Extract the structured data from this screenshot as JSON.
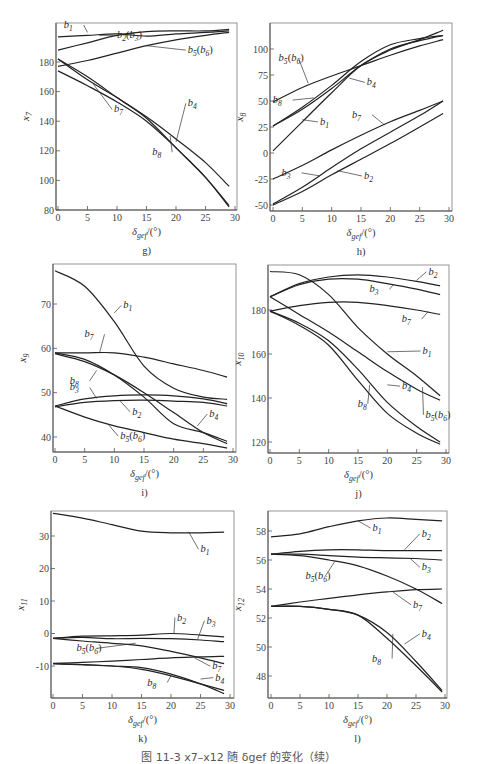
{
  "figure": {
    "caption": "图 11-3  x7–x12 随 δgef 的变化（续）",
    "x_axis_label": "δgef/(°)"
  },
  "chart_data": [
    {
      "id": "g",
      "panel_label": "g)",
      "type": "line",
      "ylabel": "x7",
      "xlabel": "δgef/(°)",
      "xlim": [
        0,
        30
      ],
      "ylim": [
        80,
        205
      ],
      "xticks": [
        0,
        5,
        10,
        15,
        20,
        25,
        30
      ],
      "yticks": [
        80,
        100,
        120,
        140,
        160,
        180
      ],
      "box": [
        56,
        23,
        237,
        210
      ],
      "xmap": [
        58,
        235
      ],
      "ymap": [
        [
          80,
          210
        ],
        [
          180,
          62
        ]
      ],
      "x": [
        0,
        5,
        10,
        15,
        20,
        25,
        29
      ],
      "series": [
        {
          "name": "b1",
          "values": [
            197,
            198,
            199,
            197.5,
            199,
            200,
            201
          ]
        },
        {
          "name": "b2(b3)",
          "values": [
            188,
            193,
            198,
            200.5,
            201,
            201,
            202
          ]
        },
        {
          "name": "b5(b6)",
          "values": [
            177,
            181,
            186,
            191,
            195,
            198,
            200
          ]
        },
        {
          "name": "b4",
          "values": [
            182,
            168,
            156,
            143,
            128,
            112,
            96
          ]
        },
        {
          "name": "b7",
          "values": [
            174,
            164,
            153,
            140,
            122,
            102,
            82
          ]
        },
        {
          "name": "b8",
          "values": [
            182,
            170,
            156,
            142,
            122,
            102,
            83
          ]
        }
      ],
      "labels": [
        {
          "text": "b1",
          "x": 3,
          "y": 203,
          "lx": 5,
          "ly": 200
        },
        {
          "text": "b2(b3)",
          "x": 10,
          "y": 196,
          "lx": 7,
          "ly": 198
        },
        {
          "text": "b5(b6)",
          "x": 22,
          "y": 186,
          "lx": 15,
          "ly": 191
        },
        {
          "text": "b7",
          "x": 9.5,
          "y": 146,
          "lx": 6,
          "ly": 165
        },
        {
          "text": "b4",
          "x": 22,
          "y": 150,
          "lx": 20,
          "ly": 126
        },
        {
          "text": "b8",
          "x": 18,
          "y": 117,
          "lx": 19,
          "ly": 130
        }
      ]
    },
    {
      "id": "h",
      "panel_label": "h)",
      "type": "line",
      "ylabel": "x8",
      "xlabel": "δgef/(°)",
      "xlim": [
        0,
        30
      ],
      "ylim": [
        -50,
        120
      ],
      "xticks": [
        0,
        5,
        10,
        15,
        20,
        25,
        30
      ],
      "yticks": [
        -50,
        -25,
        0,
        25,
        50,
        75,
        100
      ],
      "box": [
        270,
        23,
        452,
        211
      ],
      "xmap": [
        273,
        449
      ],
      "ymap": [
        [
          -50,
          205
        ],
        [
          100,
          49
        ]
      ],
      "x": [
        0,
        5,
        10,
        15,
        20,
        25,
        29
      ],
      "series": [
        {
          "name": "b5(b6)",
          "values": [
            49,
            63,
            74,
            84,
            94,
            103,
            109
          ]
        },
        {
          "name": "b4",
          "values": [
            26,
            42,
            62,
            84,
            100,
            108,
            113
          ]
        },
        {
          "name": "b8",
          "values": [
            26,
            44,
            65,
            88,
            104,
            110,
            113
          ]
        },
        {
          "name": "b1",
          "values": [
            2,
            30,
            58,
            84,
            99,
            109,
            118
          ]
        },
        {
          "name": "b7",
          "values": [
            -25,
            -12,
            3,
            17,
            30,
            41,
            50
          ]
        },
        {
          "name": "b3",
          "values": [
            -49,
            -33,
            -14,
            4,
            20,
            36,
            50
          ]
        },
        {
          "name": "b2",
          "values": [
            -50,
            -37,
            -21,
            -6,
            9,
            25,
            38
          ]
        }
      ],
      "labels": [
        {
          "text": "b5(b6)",
          "x": 3,
          "y": 88,
          "lx": 6,
          "ly": 67
        },
        {
          "text": "b8",
          "x": 2,
          "y": 48,
          "lx": 7,
          "ly": 53
        },
        {
          "text": "b4",
          "x": 16,
          "y": 65,
          "lx": 13,
          "ly": 72
        },
        {
          "text": "b1",
          "x": 8,
          "y": 27,
          "lx": 5,
          "ly": 32
        },
        {
          "text": "b7",
          "x": 15.5,
          "y": 34,
          "lx": 19,
          "ly": 27
        },
        {
          "text": "b3",
          "x": 3.5,
          "y": -22,
          "lx": 8,
          "ly": -22
        },
        {
          "text": "b2",
          "x": 15.5,
          "y": -25,
          "lx": 11,
          "ly": -17
        }
      ]
    },
    {
      "id": "i",
      "panel_label": "i)",
      "type": "line",
      "ylabel": "x9",
      "xlabel": "δgef/(°)",
      "xlim": [
        0,
        30
      ],
      "ylim": [
        37,
        78
      ],
      "xticks": [
        0,
        5,
        10,
        15,
        20,
        25,
        30
      ],
      "yticks": [
        40,
        50,
        60,
        70
      ],
      "box": [
        53,
        264,
        236,
        452
      ],
      "xmap": [
        55,
        233
      ],
      "ymap": [
        [
          40,
          437
        ],
        [
          70,
          304
        ]
      ],
      "x": [
        0,
        5,
        10,
        15,
        20,
        25,
        29
      ],
      "series": [
        {
          "name": "b1",
          "values": [
            77.5,
            74,
            66,
            56,
            51,
            49,
            48.5
          ]
        },
        {
          "name": "b7",
          "values": [
            59,
            59,
            59,
            58,
            56.5,
            55,
            53.5
          ]
        },
        {
          "name": "b8",
          "values": [
            59,
            57.5,
            54,
            49,
            43,
            41,
            39
          ]
        },
        {
          "name": "b4",
          "values": [
            58.8,
            57,
            54,
            50,
            45.5,
            41,
            38.5
          ]
        },
        {
          "name": "b3",
          "values": [
            47,
            48.6,
            49.3,
            49.5,
            49.3,
            48.6,
            47.5
          ]
        },
        {
          "name": "b2",
          "values": [
            46.8,
            47.8,
            48.2,
            48.3,
            48.1,
            47.8,
            47
          ]
        },
        {
          "name": "b5(b6)",
          "values": [
            47,
            44.5,
            42.5,
            41,
            39.5,
            38.5,
            37.5
          ]
        }
      ],
      "labels": [
        {
          "text": "b1",
          "x": 11.5,
          "y": 69,
          "lx": 10,
          "ly": 68
        },
        {
          "text": "b7",
          "x": 7,
          "y": 62.5,
          "lx": 7.5,
          "ly": 59
        },
        {
          "text": "b8",
          "x": 4.5,
          "y": 52,
          "lx": 7,
          "ly": 55
        },
        {
          "text": "b3",
          "x": 4.5,
          "y": 50.5,
          "lx": 7,
          "ly": 48.7
        },
        {
          "text": "b2",
          "x": 13,
          "y": 45,
          "lx": 11,
          "ly": 48.1
        },
        {
          "text": "b4",
          "x": 26,
          "y": 44.5,
          "lx": 24,
          "ly": 42.5
        },
        {
          "text": "b5(b6)",
          "x": 11,
          "y": 39.5,
          "lx": 9,
          "ly": 42.8
        }
      ]
    },
    {
      "id": "j",
      "panel_label": "j)",
      "type": "line",
      "ylabel": "x10",
      "xlabel": "δgef/(°)",
      "xlim": [
        0,
        30
      ],
      "ylim": [
        118,
        199
      ],
      "xticks": [
        0,
        5,
        10,
        15,
        20,
        25,
        30
      ],
      "yticks": [
        120,
        140,
        160,
        180
      ],
      "box": [
        268,
        265,
        449,
        453
      ],
      "xmap": [
        270,
        446
      ],
      "ymap": [
        [
          120,
          442
        ],
        [
          180,
          310
        ]
      ],
      "x": [
        0,
        5,
        10,
        15,
        20,
        25,
        29
      ],
      "series": [
        {
          "name": "b2",
          "values": [
            186,
            192,
            195,
            196,
            195,
            193,
            191
          ]
        },
        {
          "name": "b3",
          "values": [
            186,
            191.5,
            194,
            194,
            192,
            189.5,
            187
          ]
        },
        {
          "name": "b7",
          "values": [
            179.5,
            182,
            183.5,
            183.5,
            182,
            180,
            178
          ]
        },
        {
          "name": "b1",
          "values": [
            197.5,
            196,
            187,
            172,
            160,
            150,
            141
          ]
        },
        {
          "name": "b5(b6)",
          "values": [
            186,
            178,
            170,
            161,
            152,
            144,
            139
          ]
        },
        {
          "name": "b4",
          "values": [
            179.5,
            174,
            166,
            153,
            138,
            127,
            120
          ]
        },
        {
          "name": "b8",
          "values": [
            179.5,
            173,
            164,
            148,
            133,
            124,
            119
          ]
        }
      ],
      "labels": [
        {
          "text": "b2",
          "x": 27,
          "y": 196,
          "lx": 25,
          "ly": 193.5
        },
        {
          "text": "b3",
          "x": 19,
          "y": 188,
          "lx": 21,
          "ly": 191.5
        },
        {
          "text": "b7",
          "x": 24.5,
          "y": 174.5,
          "lx": 27,
          "ly": 179.5
        },
        {
          "text": "b1",
          "x": 26,
          "y": 160,
          "lx": 20,
          "ly": 161
        },
        {
          "text": "b4",
          "x": 22.5,
          "y": 144,
          "lx": 20,
          "ly": 146
        },
        {
          "text": "b8",
          "x": 17,
          "y": 136,
          "lx": 17,
          "ly": 146
        },
        {
          "text": "b5(b6)",
          "x": 26.5,
          "y": 131,
          "lx": 26,
          "ly": 145
        }
      ]
    },
    {
      "id": "k",
      "panel_label": "k)",
      "type": "line",
      "ylabel": "x11",
      "xlabel": "δgef/(°)",
      "xlim": [
        0,
        30
      ],
      "ylim": [
        -19,
        38
      ],
      "xticks": [
        0,
        5,
        10,
        15,
        20,
        25,
        30
      ],
      "yticks": [
        -10,
        0,
        10,
        20,
        30
      ],
      "box": [
        51,
        511,
        234,
        698
      ],
      "xmap": [
        53,
        230
      ],
      "ymap": [
        [
          30,
          536
        ],
        [
          -10,
          666
        ]
      ],
      "x": [
        0,
        5,
        10,
        15,
        20,
        25,
        29
      ],
      "series": [
        {
          "name": "b1",
          "values": [
            37,
            35.5,
            33.5,
            31.5,
            31,
            31,
            31.2
          ]
        },
        {
          "name": "b2",
          "values": [
            -1.5,
            -0.8,
            -0.7,
            -0.5,
            0,
            -0.5,
            -1
          ]
        },
        {
          "name": "b3",
          "values": [
            -1.5,
            -1.2,
            -1.6,
            -1.5,
            -1.6,
            -2,
            -2.5
          ]
        },
        {
          "name": "b5(b6)",
          "values": [
            -1.5,
            -2.3,
            -3,
            -3.8,
            -5.5,
            -7.5,
            -9.3
          ]
        },
        {
          "name": "b7",
          "values": [
            -9.2,
            -8.9,
            -8.5,
            -8,
            -7.5,
            -7.2,
            -7
          ]
        },
        {
          "name": "b4",
          "values": [
            -9.3,
            -9.6,
            -10,
            -11,
            -13,
            -15.5,
            -17.5
          ]
        },
        {
          "name": "b8",
          "values": [
            -9.3,
            -9.6,
            -10,
            -10.5,
            -12.5,
            -15.5,
            -18.5
          ]
        }
      ],
      "labels": [
        {
          "text": "b1",
          "x": 25,
          "y": 25,
          "lx": 23,
          "ly": 31.3
        },
        {
          "text": "b2",
          "x": 21,
          "y": 4,
          "lx": 20.5,
          "ly": 0
        },
        {
          "text": "b3",
          "x": 26,
          "y": 3,
          "lx": 24.5,
          "ly": -1.8
        },
        {
          "text": "b5(b6)",
          "x": 6,
          "y": -5.5,
          "lx": 14,
          "ly": -3
        },
        {
          "text": "b7",
          "x": 27,
          "y": -11,
          "lx": 24,
          "ly": -7.5
        },
        {
          "text": "b4",
          "x": 27.5,
          "y": -14.5,
          "lx": 25,
          "ly": -14
        },
        {
          "text": "b8",
          "x": 18,
          "y": -16,
          "lx": 20,
          "ly": -13
        }
      ]
    },
    {
      "id": "l",
      "panel_label": "l)",
      "type": "line",
      "ylabel": "x12",
      "xlabel": "δgef/(°)",
      "xlim": [
        0,
        30
      ],
      "ylim": [
        46.8,
        59.2
      ],
      "xticks": [
        0,
        5,
        10,
        15,
        20,
        25,
        30
      ],
      "yticks": [
        48,
        50,
        52,
        54,
        56,
        58
      ],
      "box": [
        268,
        511,
        447,
        698
      ],
      "xmap": [
        271,
        445
      ],
      "ymap": [
        [
          48,
          676
        ],
        [
          58,
          531
        ]
      ],
      "x": [
        0,
        5,
        10,
        15,
        20,
        25,
        29.5
      ],
      "series": [
        {
          "name": "b1",
          "values": [
            57.6,
            57.8,
            58.3,
            58.7,
            58.9,
            58.8,
            58.7
          ]
        },
        {
          "name": "b2",
          "values": [
            56.4,
            56.6,
            56.7,
            56.7,
            56.65,
            56.65,
            56.65
          ]
        },
        {
          "name": "b3",
          "values": [
            56.4,
            56.4,
            56.3,
            56.2,
            56.15,
            56.1,
            56.0
          ]
        },
        {
          "name": "b5(b6)",
          "values": [
            56.4,
            56.3,
            56.0,
            55.6,
            54.9,
            54.0,
            53.0
          ]
        },
        {
          "name": "b7",
          "values": [
            52.8,
            53.1,
            53.35,
            53.6,
            53.8,
            53.95,
            54.0
          ]
        },
        {
          "name": "b4",
          "values": [
            52.8,
            52.8,
            52.6,
            52.2,
            51.0,
            49.0,
            47.0
          ]
        },
        {
          "name": "b8",
          "values": [
            52.8,
            52.8,
            52.6,
            52.2,
            50.6,
            48.7,
            46.9
          ]
        }
      ],
      "labels": [
        {
          "text": "b1",
          "x": 17.5,
          "y": 58,
          "lx": 15,
          "ly": 58.7
        },
        {
          "text": "b2",
          "x": 26,
          "y": 57.6,
          "lx": 23,
          "ly": 56.7
        },
        {
          "text": "b3",
          "x": 26,
          "y": 55.3,
          "lx": 24,
          "ly": 56.1
        },
        {
          "text": "b5(b6)",
          "x": 8,
          "y": 54.7,
          "lx": 11,
          "ly": 55.9
        },
        {
          "text": "b7",
          "x": 24.5,
          "y": 52.7,
          "lx": 21,
          "ly": 53.8
        },
        {
          "text": "b4",
          "x": 26,
          "y": 50.7,
          "lx": 23,
          "ly": 50.2
        },
        {
          "text": "b8",
          "x": 19.5,
          "y": 49,
          "lx": 21,
          "ly": 50.9
        }
      ]
    }
  ]
}
